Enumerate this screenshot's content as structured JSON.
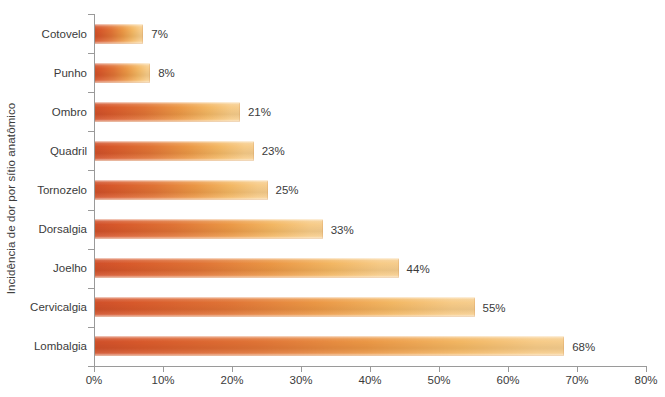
{
  "chart_data": {
    "type": "bar",
    "orientation": "horizontal",
    "title": "",
    "subtitle": "",
    "xlabel": "",
    "ylabel": "Incidência de dor por sítio anatômico",
    "categories": [
      "Cotovelo",
      "Punho",
      "Ombro",
      "Quadril",
      "Tornozelo",
      "Dorsalgia",
      "Joelho",
      "Cervicalgia",
      "Lombalgia"
    ],
    "values": [
      7,
      8,
      21,
      23,
      25,
      33,
      44,
      55,
      68
    ],
    "data_labels": [
      "7%",
      "8%",
      "21%",
      "23%",
      "25%",
      "33%",
      "44%",
      "55%",
      "68%"
    ],
    "xlim": [
      0,
      80
    ],
    "xticks": [
      0,
      10,
      20,
      30,
      40,
      50,
      60,
      70,
      80
    ],
    "xtick_labels": [
      "0%",
      "10%",
      "20%",
      "30%",
      "40%",
      "50%",
      "60%",
      "70%",
      "80%"
    ],
    "grid": false,
    "legend": false,
    "legend_position": "none",
    "bar_color_start": "#d0502a",
    "bar_color_end": "#f6cd8d",
    "axis_color": "#9a9a9a",
    "text_color": "#3b3b3b",
    "background_color": "#ffffff"
  }
}
